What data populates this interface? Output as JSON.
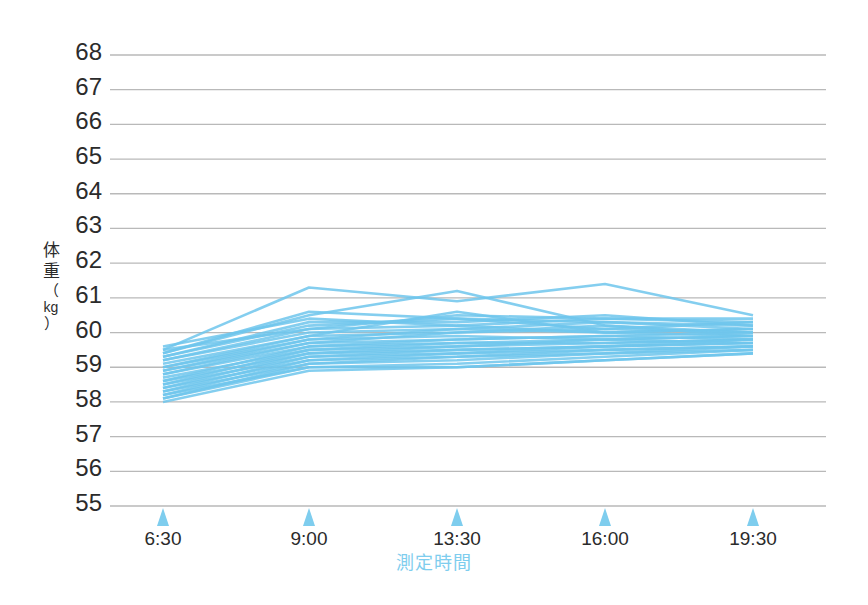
{
  "chart_data": {
    "type": "line",
    "title": "",
    "xlabel": "測定時間",
    "ylabel": "体重（kg）",
    "ylabel_parts": {
      "line1": "体",
      "line2": "重",
      "paren_open": "（",
      "unit": "kg",
      "paren_close": "）"
    },
    "x": [
      "6:30",
      "9:00",
      "13:30",
      "16:00",
      "19:30"
    ],
    "xtick_labels": [
      "6:30",
      "9:00",
      "13:30",
      "16:00",
      "19:30"
    ],
    "ytick_labels": [
      "68",
      "67",
      "66",
      "65",
      "64",
      "63",
      "62",
      "61",
      "60",
      "59",
      "58",
      "57",
      "56",
      "55"
    ],
    "ylim": [
      55,
      68
    ],
    "grid": true,
    "legend": "none",
    "line_color": "#6ec6ec",
    "grid_color": "#b9b9b9",
    "tick_marker_color": "#7ecdee",
    "axis_title_color": "#7ecdee",
    "series": [
      {
        "name": "subject-01",
        "values": [
          59.6,
          60.4,
          60.2,
          60.0,
          60.1
        ]
      },
      {
        "name": "subject-02",
        "values": [
          59.5,
          61.3,
          60.9,
          61.4,
          60.5
        ]
      },
      {
        "name": "subject-03",
        "values": [
          59.4,
          60.5,
          61.2,
          60.2,
          60.0
        ]
      },
      {
        "name": "subject-04",
        "values": [
          59.3,
          60.2,
          60.4,
          60.3,
          60.2
        ]
      },
      {
        "name": "subject-05",
        "values": [
          59.2,
          60.0,
          60.1,
          60.0,
          59.9
        ]
      },
      {
        "name": "subject-06",
        "values": [
          59.1,
          59.9,
          60.0,
          60.1,
          60.0
        ]
      },
      {
        "name": "subject-07",
        "values": [
          59.0,
          59.8,
          59.9,
          59.8,
          59.9
        ]
      },
      {
        "name": "subject-08",
        "values": [
          58.9,
          59.7,
          59.8,
          59.9,
          59.8
        ]
      },
      {
        "name": "subject-09",
        "values": [
          58.8,
          59.6,
          59.7,
          59.7,
          59.8
        ]
      },
      {
        "name": "subject-10",
        "values": [
          58.7,
          59.5,
          59.6,
          59.8,
          59.7
        ]
      },
      {
        "name": "subject-11",
        "values": [
          58.6,
          59.4,
          59.5,
          59.6,
          59.7
        ]
      },
      {
        "name": "subject-12",
        "values": [
          58.5,
          59.3,
          59.4,
          59.5,
          59.6
        ]
      },
      {
        "name": "subject-13",
        "values": [
          58.4,
          59.2,
          59.3,
          59.5,
          59.6
        ]
      },
      {
        "name": "subject-14",
        "values": [
          58.3,
          59.1,
          59.2,
          59.4,
          59.5
        ]
      },
      {
        "name": "subject-15",
        "values": [
          58.2,
          59.0,
          59.1,
          59.3,
          59.5
        ]
      },
      {
        "name": "subject-16",
        "values": [
          58.1,
          59.0,
          59.0,
          59.2,
          59.4
        ]
      },
      {
        "name": "subject-17",
        "values": [
          58.0,
          58.9,
          59.0,
          59.2,
          59.4
        ]
      },
      {
        "name": "subject-18",
        "values": [
          59.5,
          60.1,
          60.5,
          60.4,
          60.3
        ]
      },
      {
        "name": "subject-19",
        "values": [
          59.3,
          60.3,
          60.3,
          60.5,
          60.2
        ]
      },
      {
        "name": "subject-20",
        "values": [
          59.0,
          59.9,
          60.6,
          60.0,
          60.1
        ]
      },
      {
        "name": "subject-21",
        "values": [
          58.8,
          59.7,
          60.0,
          60.2,
          59.9
        ]
      },
      {
        "name": "subject-22",
        "values": [
          58.6,
          59.6,
          59.8,
          59.9,
          60.0
        ]
      },
      {
        "name": "subject-23",
        "values": [
          58.4,
          59.4,
          59.6,
          59.7,
          59.8
        ]
      },
      {
        "name": "subject-24",
        "values": [
          58.2,
          59.2,
          59.4,
          59.6,
          59.7
        ]
      },
      {
        "name": "subject-25",
        "values": [
          58.1,
          59.1,
          59.3,
          59.4,
          59.6
        ]
      },
      {
        "name": "subject-26",
        "values": [
          59.4,
          60.6,
          60.4,
          60.1,
          60.3
        ]
      },
      {
        "name": "subject-27",
        "values": [
          59.2,
          60.1,
          60.2,
          60.4,
          60.4
        ]
      },
      {
        "name": "subject-28",
        "values": [
          58.9,
          59.8,
          60.1,
          60.3,
          60.1
        ]
      },
      {
        "name": "subject-29",
        "values": [
          58.5,
          59.5,
          59.7,
          59.8,
          59.9
        ]
      },
      {
        "name": "subject-30",
        "values": [
          58.3,
          59.3,
          59.5,
          59.6,
          59.8
        ]
      }
    ]
  }
}
